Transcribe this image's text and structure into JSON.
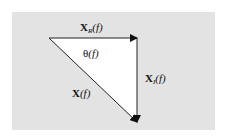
{
  "diagram": {
    "type": "vector-triangle",
    "background_color": "#e3e3e3",
    "fill_color": "#ffffff",
    "line_color": "#222222",
    "labels": {
      "real_part": {
        "symbol": "X",
        "subscript": "R",
        "arg": "(f)"
      },
      "imag_part": {
        "symbol": "X",
        "subscript": "I",
        "arg": "(f)"
      },
      "magnitude": {
        "symbol": "X",
        "arg": "(f)"
      },
      "angle": {
        "symbol": "θ",
        "arg": "(f)"
      }
    },
    "vertices": {
      "origin": [
        49,
        38
      ],
      "corner": [
        137,
        38
      ],
      "tip": [
        137,
        122
      ]
    }
  }
}
